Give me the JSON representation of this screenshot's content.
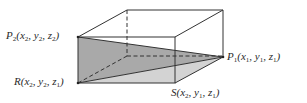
{
  "diagram": {
    "type": "3d-box-with-shaded-triangles",
    "colors": {
      "background": "#ffffff",
      "edge": "#333333",
      "triangle_upper": "#a9a9a9",
      "triangle_lower": "#d3d3d3"
    },
    "points": {
      "P2": {
        "name": "P",
        "sub": "2",
        "coords_text": "(x",
        "coords": [
          "x2",
          "y2",
          "z2"
        ]
      },
      "R": {
        "name": "R",
        "coords": [
          "x2",
          "y2",
          "z1"
        ]
      },
      "P1": {
        "name": "P",
        "sub": "1",
        "coords": [
          "x1",
          "y1",
          "z1"
        ]
      },
      "S": {
        "name": "S",
        "coords": [
          "x2",
          "y1",
          "z1"
        ]
      }
    },
    "labels": {
      "P2": {
        "main": "P",
        "sub": "2",
        "open": "(x",
        "a_sub": "2",
        "mid1": ", y",
        "b_sub": "2",
        "mid2": ", z",
        "c_sub": "2",
        "close": ")"
      },
      "R": {
        "main": "R",
        "sub": "",
        "open": "(x",
        "a_sub": "2",
        "mid1": ", y",
        "b_sub": "2",
        "mid2": ", z",
        "c_sub": "1",
        "close": ")"
      },
      "P1": {
        "main": "P",
        "sub": "1",
        "open": "(x",
        "a_sub": "1",
        "mid1": ", y",
        "b_sub": "1",
        "mid2": ", z",
        "c_sub": "1",
        "close": ")"
      },
      "S": {
        "main": "S",
        "sub": "",
        "open": "(x",
        "a_sub": "2",
        "mid1": ", y",
        "b_sub": "1",
        "mid2": ", z",
        "c_sub": "1",
        "close": ")"
      }
    }
  }
}
